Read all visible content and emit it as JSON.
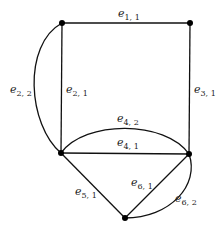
{
  "diagram": {
    "type": "multigraph",
    "nodes": [
      {
        "id": "v1",
        "x": 62,
        "y": 23
      },
      {
        "id": "v2",
        "x": 190,
        "y": 23
      },
      {
        "id": "v3",
        "x": 61,
        "y": 153
      },
      {
        "id": "v4",
        "x": 189,
        "y": 154
      },
      {
        "id": "v5",
        "x": 125,
        "y": 218
      }
    ],
    "edges": [
      {
        "id": "e11",
        "base": "e",
        "sub": "1, 1",
        "from": "v1",
        "to": "v2",
        "shape": "line"
      },
      {
        "id": "e21",
        "base": "e",
        "sub": "2, 1",
        "from": "v1",
        "to": "v3",
        "shape": "line"
      },
      {
        "id": "e22",
        "base": "e",
        "sub": "2, 2",
        "from": "v1",
        "to": "v3",
        "shape": "curve-left"
      },
      {
        "id": "e31",
        "base": "e",
        "sub": "3, 1",
        "from": "v2",
        "to": "v4",
        "shape": "line"
      },
      {
        "id": "e41",
        "base": "e",
        "sub": "4, 1",
        "from": "v3",
        "to": "v4",
        "shape": "line"
      },
      {
        "id": "e42",
        "base": "e",
        "sub": "4, 2",
        "from": "v3",
        "to": "v4",
        "shape": "curve-up"
      },
      {
        "id": "e51",
        "base": "e",
        "sub": "5, 1",
        "from": "v3",
        "to": "v5",
        "shape": "line"
      },
      {
        "id": "e61",
        "base": "e",
        "sub": "6, 1",
        "from": "v5",
        "to": "v4",
        "shape": "line"
      },
      {
        "id": "e62",
        "base": "e",
        "sub": "6, 2",
        "from": "v5",
        "to": "v4",
        "shape": "curve-right"
      }
    ],
    "labels": {
      "e11": {
        "base": "e",
        "sub": "1, 1"
      },
      "e21": {
        "base": "e",
        "sub": "2, 1"
      },
      "e22": {
        "base": "e",
        "sub": "2, 2"
      },
      "e31": {
        "base": "e",
        "sub": "3, 1"
      },
      "e41": {
        "base": "e",
        "sub": "4, 1"
      },
      "e42": {
        "base": "e",
        "sub": "4, 2"
      },
      "e51": {
        "base": "e",
        "sub": "5, 1"
      },
      "e61": {
        "base": "e",
        "sub": "6, 1"
      },
      "e62": {
        "base": "e",
        "sub": "6, 2"
      }
    }
  }
}
